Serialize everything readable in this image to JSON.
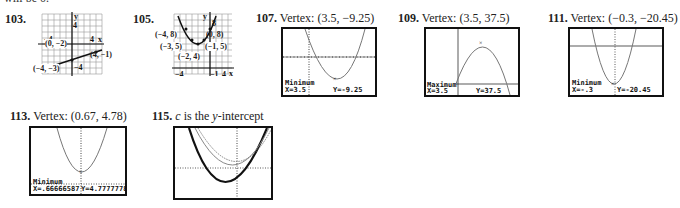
{
  "page": {
    "top_cut_text": "will be 0."
  },
  "answers": [
    {
      "number": "103.",
      "label": "",
      "graph_type": "hand-drawn grid graph",
      "points": [
        "(0, −2)",
        "(4, −1)",
        "(−4, −3)"
      ],
      "axis_labels": {
        "x": "x",
        "y": "y",
        "x_left": "−4",
        "x_right": "4",
        "y_top": "4",
        "y_bottom": "−4"
      }
    },
    {
      "number": "105.",
      "label": "",
      "graph_type": "hand-drawn grid graph",
      "points": [
        "(−4, 8)",
        "(0, 8)",
        "(−3, 5)",
        "(−1, 5)",
        "(−2, 4)"
      ],
      "axis_labels": {
        "x": "x",
        "y": "y",
        "y_top": "8",
        "x_left": "−4",
        "x_neg1": "−1",
        "x_right": "4"
      }
    },
    {
      "number": "107.",
      "label": "Vertex: (3.5, −9.25)",
      "screen": {
        "mode": "Minimum",
        "x_readout": "X=3.5",
        "y_readout": "Y=-9.25"
      }
    },
    {
      "number": "109.",
      "label": "Vertex: (3.5, 37.5)",
      "screen": {
        "mode": "Maximum",
        "x_readout": "X=3.5",
        "y_readout": "Y=37.5"
      }
    },
    {
      "number": "111.",
      "label": "Vertex: (−0.3, −20.45)",
      "screen": {
        "mode": "Minimum",
        "x_readout": "X=-.3",
        "y_readout": "Y=-20.45"
      }
    },
    {
      "number": "113.",
      "label": "Vertex: (0.67, 4.78)",
      "screen": {
        "mode": "Minimum",
        "x_readout": "X=.66666587",
        "y_readout": "Y=4.7777778"
      }
    },
    {
      "number": "115.",
      "label_italic_c": "c",
      "label_mid": " is the ",
      "label_italic_y": "y",
      "label_end": "-intercept"
    }
  ]
}
